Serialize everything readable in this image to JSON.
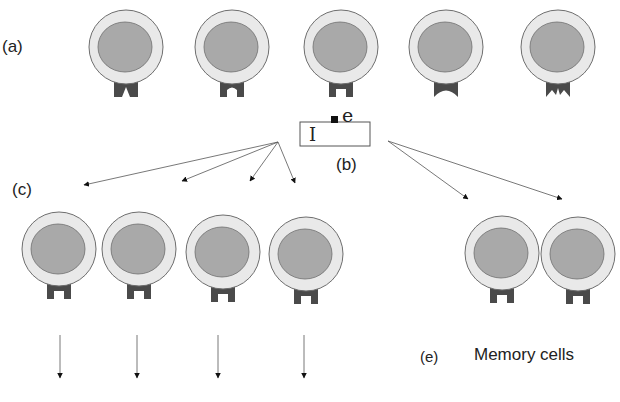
{
  "labels": {
    "a": "(a)",
    "b": "(b)",
    "c": "(c)",
    "e": "(e)",
    "memory_cells": "Memory cells",
    "antigen_letter": "e",
    "box_letter": "I"
  },
  "colors": {
    "cytoplasm": "#e9e9e9",
    "nucleus": "#a9a9a9",
    "outline": "#6e6e6e",
    "receptor": "#4a4a4a",
    "arrow": "#555555",
    "arrowhead": "#111111"
  },
  "row_a_cells": [
    {
      "cx": 126,
      "cy": 47,
      "receptor": "v-notch"
    },
    {
      "cx": 232,
      "cy": 47,
      "receptor": "round-notch"
    },
    {
      "cx": 341,
      "cy": 47,
      "receptor": "square-notch"
    },
    {
      "cx": 446,
      "cy": 47,
      "receptor": "arch-notch"
    },
    {
      "cx": 558,
      "cy": 47,
      "receptor": "m-notch"
    }
  ],
  "clone_cells": [
    {
      "cx": 59,
      "cy": 249,
      "receptor": "square-notch"
    },
    {
      "cx": 139,
      "cy": 249,
      "receptor": "square-notch"
    },
    {
      "cx": 223,
      "cy": 252,
      "receptor": "square-notch"
    },
    {
      "cx": 306,
      "cy": 254,
      "receptor": "square-notch"
    }
  ],
  "memory_cells": [
    {
      "cx": 502,
      "cy": 253,
      "receptor": "square-notch"
    },
    {
      "cx": 578,
      "cy": 254,
      "receptor": "square-notch"
    }
  ],
  "down_arrows_x": [
    60,
    137,
    218,
    304
  ]
}
